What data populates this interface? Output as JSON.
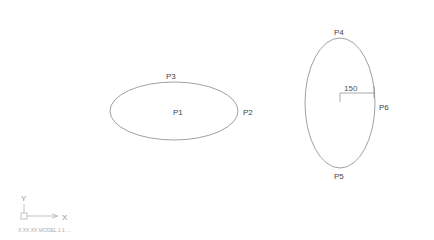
{
  "drawing": {
    "colors": {
      "line": "#777777",
      "text": "#444444",
      "ucs": "#999999",
      "background": "#ffffff"
    },
    "ellipse_horizontal": {
      "cx": 174,
      "cy": 111,
      "rx": 64,
      "ry": 29,
      "labels": {
        "center": "P1",
        "right": "P2",
        "top": "P3"
      }
    },
    "ellipse_vertical": {
      "cx": 340,
      "cy": 103,
      "rx": 35,
      "ry": 65,
      "labels": {
        "top": "P4",
        "bottom": "P5",
        "right": "P6"
      },
      "dimension": {
        "value": "150"
      }
    },
    "ucs_icon": {
      "x_label": "X",
      "y_label": "Y"
    }
  },
  "status_bar": {
    "text": "X:XX,XX MODEL 1:1 ..."
  }
}
